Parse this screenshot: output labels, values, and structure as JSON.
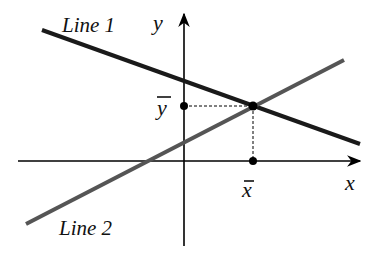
{
  "diagram": {
    "title": "",
    "axes": {
      "x_label": "x",
      "y_label": "y"
    },
    "lines": [
      {
        "label": "Line 1",
        "color": "#1a1a1a",
        "slope_sign": "negative"
      },
      {
        "label": "Line 2",
        "color": "#555555",
        "slope_sign": "positive"
      }
    ],
    "intersection": {
      "x_label": "x̄",
      "y_label": "ȳ"
    },
    "colors": {
      "axis": "#000000",
      "line1": "#1a1a1a",
      "line2": "#555555",
      "guides": "#000000"
    }
  }
}
